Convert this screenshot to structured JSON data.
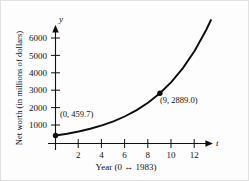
{
  "chart_data": {
    "type": "line",
    "title": "",
    "xlabel": "Year (0 ↔ 1983)",
    "ylabel": "Net worth (in millions of dollars)",
    "x_axis_symbol": "t",
    "y_axis_symbol": "y",
    "xlim": [
      -0.6,
      13.8
    ],
    "ylim": [
      0,
      6900
    ],
    "xticks": [
      2,
      4,
      6,
      8,
      10,
      12
    ],
    "xticklabels": [
      "2",
      "4",
      "6",
      "8",
      "10",
      "12"
    ],
    "yticks": [
      1000,
      2000,
      3000,
      4000,
      5000,
      6000
    ],
    "yticklabels": [
      "1000",
      "2000",
      "3000",
      "4000",
      "5000",
      "6000"
    ],
    "grid": false,
    "legend": "none",
    "curve_model": "y = 459.7 * e^(0.2042 t)",
    "curve_color": "#0d0d0d",
    "series": [
      {
        "name": "Net worth",
        "x": [
          0,
          1,
          2,
          3,
          4,
          5,
          6,
          7,
          8,
          9,
          10,
          11,
          12,
          13,
          13.4
        ],
        "values": [
          459.7,
          563.9,
          691.7,
          848.4,
          1040.7,
          1276.6,
          1565.9,
          1920.7,
          2356.1,
          2889.0,
          3543.9,
          4347.2,
          5332.1,
          6540.0,
          7098.0
        ]
      }
    ],
    "points": [
      {
        "label": "(0,  459.7)",
        "x": 0,
        "y": 459.7,
        "marker": "filled-circle"
      },
      {
        "label": "(9,  2889.0)",
        "x": 9,
        "y": 2889.0,
        "marker": "filled-circle"
      }
    ]
  }
}
